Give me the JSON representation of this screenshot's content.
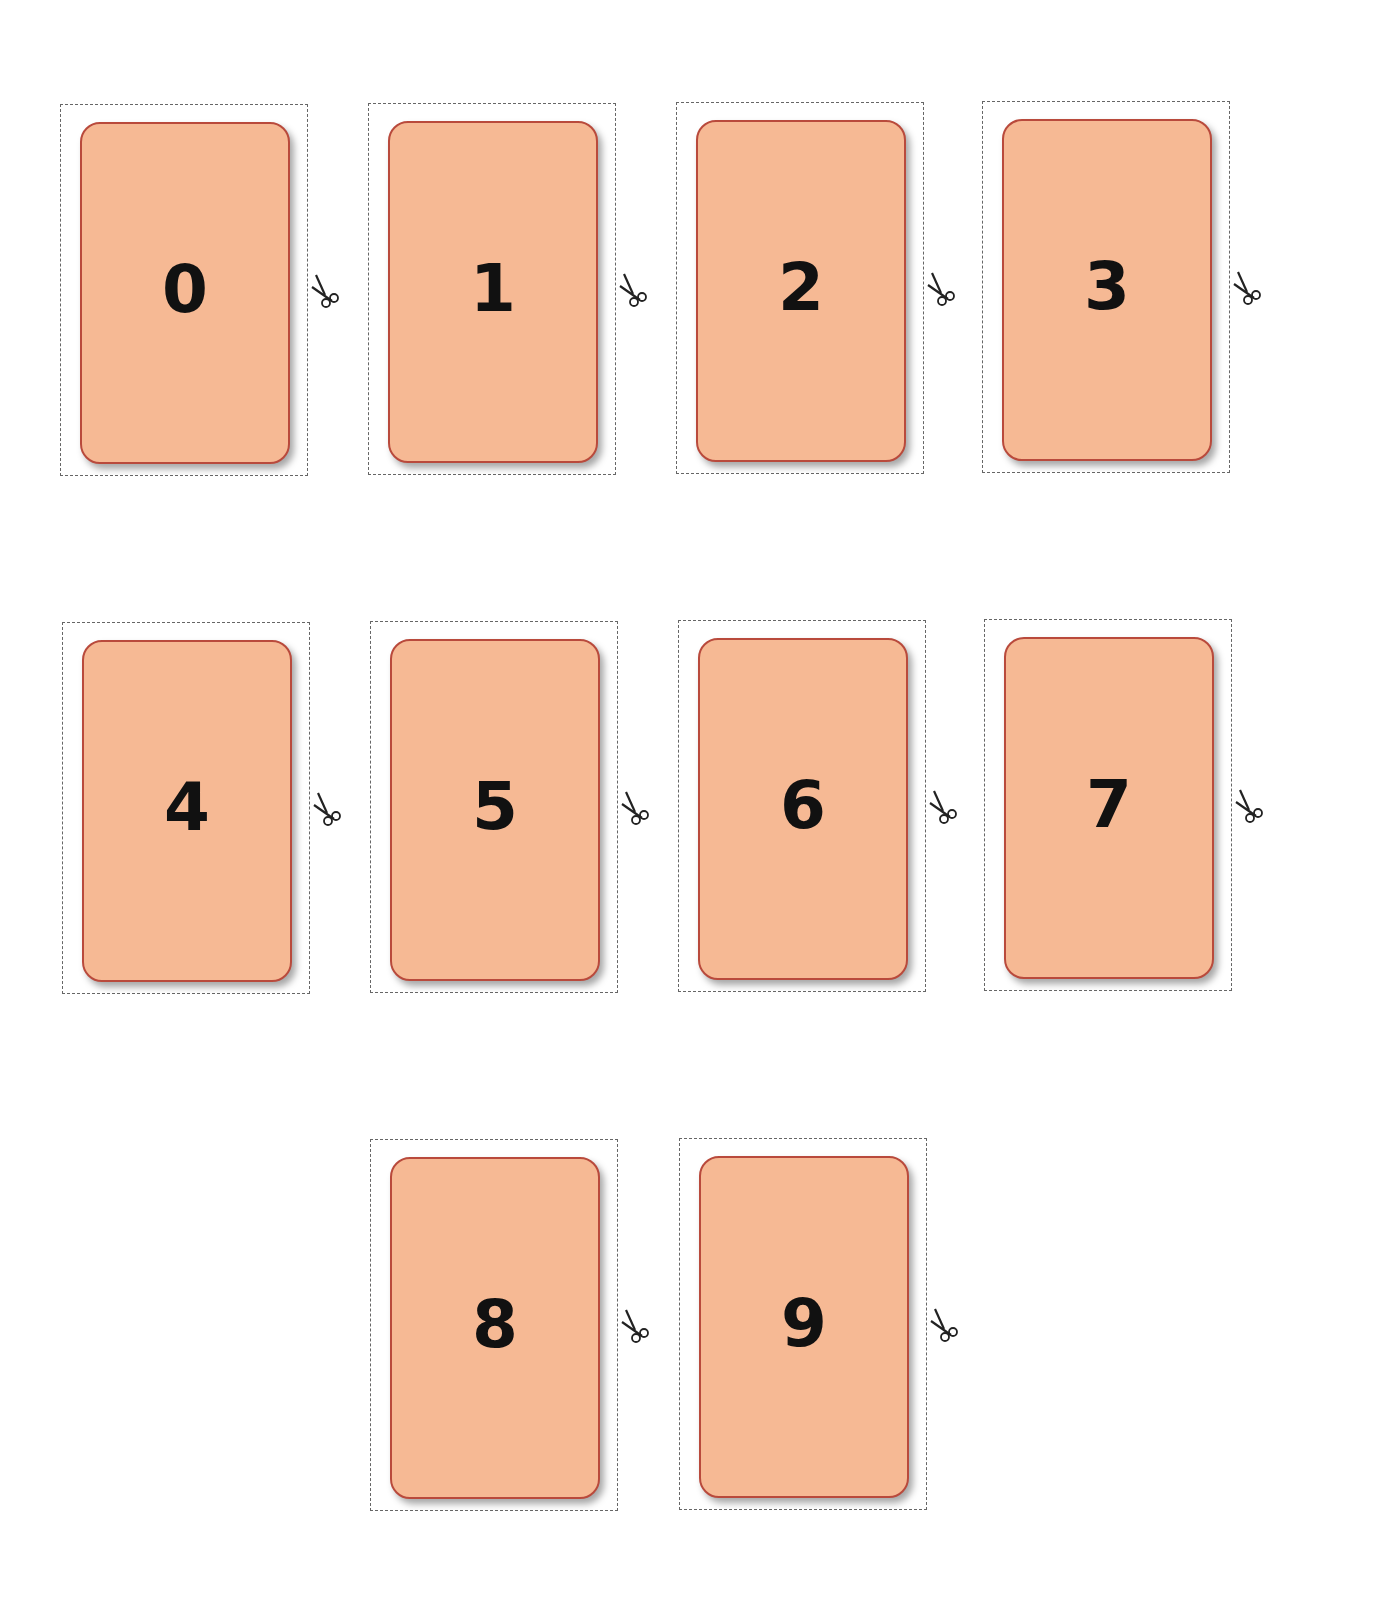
{
  "sheet": {
    "background": "#ffffff",
    "card_fill": "#f6b994",
    "card_border": "#b94a3c",
    "cut_line": "#666666",
    "cards": [
      {
        "label": "0",
        "x": 60,
        "y": 104
      },
      {
        "label": "1",
        "x": 368,
        "y": 103
      },
      {
        "label": "2",
        "x": 676,
        "y": 102
      },
      {
        "label": "3",
        "x": 982,
        "y": 101
      },
      {
        "label": "4",
        "x": 62,
        "y": 622
      },
      {
        "label": "5",
        "x": 370,
        "y": 621
      },
      {
        "label": "6",
        "x": 678,
        "y": 620
      },
      {
        "label": "7",
        "x": 984,
        "y": 619
      },
      {
        "label": "8",
        "x": 370,
        "y": 1139
      },
      {
        "label": "9",
        "x": 679,
        "y": 1138
      }
    ],
    "icon": "scissors-icon"
  }
}
